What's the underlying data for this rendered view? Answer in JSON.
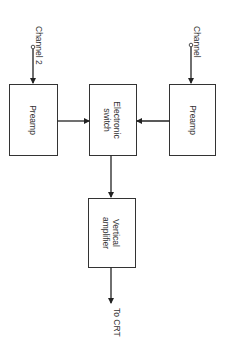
{
  "diagram": {
    "type": "block-diagram",
    "orientation": "rotated 90 degrees clockwise",
    "blocks": [
      {
        "id": "preamp-ch2",
        "label": "Preamp"
      },
      {
        "id": "electronic-switch",
        "label_line1": "Electronic",
        "label_line2": "switch"
      },
      {
        "id": "preamp-ch1",
        "label": "Preamp"
      },
      {
        "id": "vertical-amplifier",
        "label_line1": "Vertical",
        "label_line2": "amplifier"
      }
    ],
    "inputs": {
      "channel2": "Channel 2",
      "channel1": "Channel"
    },
    "output": {
      "label": "To CRT"
    },
    "connections": [
      {
        "from": "Channel 2",
        "to": "preamp-ch2"
      },
      {
        "from": "Channel",
        "to": "preamp-ch1"
      },
      {
        "from": "preamp-ch2",
        "to": "electronic-switch"
      },
      {
        "from": "preamp-ch1",
        "to": "electronic-switch"
      },
      {
        "from": "electronic-switch",
        "to": "vertical-amplifier"
      },
      {
        "from": "vertical-amplifier",
        "to": "To CRT"
      }
    ]
  }
}
